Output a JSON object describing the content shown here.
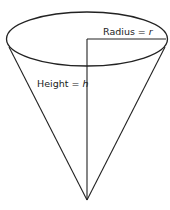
{
  "diagram": {
    "labels": {
      "radius_text": "Radius = ",
      "radius_var": "r",
      "height_text": "Height = ",
      "height_var": "h"
    },
    "colors": {
      "stroke": "#222222",
      "background": "#ffffff"
    }
  }
}
